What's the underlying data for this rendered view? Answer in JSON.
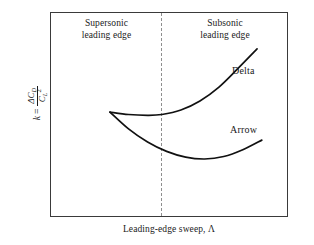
{
  "figure": {
    "background_color": "#ffffff",
    "frame_color": "#3a3a3a",
    "curve_color": "#111111",
    "divider_color": "#8e8e8e"
  },
  "regions": {
    "left": {
      "line1": "Supersonic",
      "line2": "leading edge"
    },
    "right": {
      "line1": "Subsonic",
      "line2": "leading edge"
    }
  },
  "axes": {
    "x_label": "Leading-edge sweep, Λ",
    "y_label_variable": "k",
    "y_label_equals": "=",
    "y_label_numerator_delta": "ΔC",
    "y_label_numerator_sub": "D",
    "y_label_denominator": "C",
    "y_label_denominator_sub": "L",
    "y_label_denominator_sup": "2",
    "y_label_plain": "k = ΔC_D / C_L^2"
  },
  "curves": [
    {
      "name": "Delta",
      "label": "Delta"
    },
    {
      "name": "Arrow",
      "label": "Arrow"
    }
  ],
  "chart_data": {
    "type": "line",
    "title": "",
    "subtitle": "",
    "xlabel": "Leading-edge sweep, Λ",
    "ylabel": "k = ΔC_D / C_L^2",
    "grid": false,
    "legend_position": "inline-annotation",
    "axis_ticks": {
      "x": [],
      "y": []
    },
    "xlim": [
      0,
      100
    ],
    "ylim": [
      0,
      100
    ],
    "annotations": [
      {
        "text": "Supersonic leading edge",
        "position": "top-left-region"
      },
      {
        "text": "Subsonic leading edge",
        "position": "top-right-region"
      },
      {
        "text": "Delta",
        "position": "end-of-delta-curve"
      },
      {
        "text": "Arrow",
        "position": "end-of-arrow-curve"
      }
    ],
    "vertical_divider": {
      "style": "dashed",
      "x_fraction": 0.466,
      "meaning": "boundary between supersonic and subsonic leading edge"
    },
    "series": [
      {
        "name": "Delta",
        "x": [
          25.2,
          33,
          41,
          47,
          55,
          63,
          71,
          79,
          87
        ],
        "y": [
          51.2,
          50.0,
          49.6,
          50.0,
          52.2,
          56.6,
          63.4,
          72.5,
          82.0
        ]
      },
      {
        "name": "Arrow",
        "x": [
          25.2,
          33,
          41,
          49,
          57,
          65,
          73,
          81,
          89
        ],
        "y": [
          51.2,
          43.0,
          36.6,
          32.0,
          29.2,
          28.3,
          29.5,
          32.8,
          37.5
        ]
      }
    ]
  }
}
